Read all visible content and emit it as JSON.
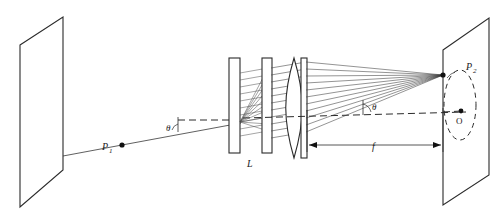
{
  "figure": {
    "labels": {
      "source_point": "P",
      "source_point_sub": "1",
      "image_point": "P",
      "image_point_sub": "2",
      "optic_axis_origin": "O",
      "grating_assembly": "L",
      "focal_length": "f",
      "angle_in": "θ",
      "angle_out": "θ"
    },
    "colors": {
      "ink": "#2b2b2b",
      "ray": "#3a3a3a",
      "background": "#ffffff"
    },
    "elements": {
      "left_screen": "object-plane-screen",
      "right_screen": "image-plane-screen",
      "lens": "converging-lens",
      "plate_1": "grating-plate-left",
      "plate_2": "grating-plate-right",
      "ray_count": 11
    }
  }
}
